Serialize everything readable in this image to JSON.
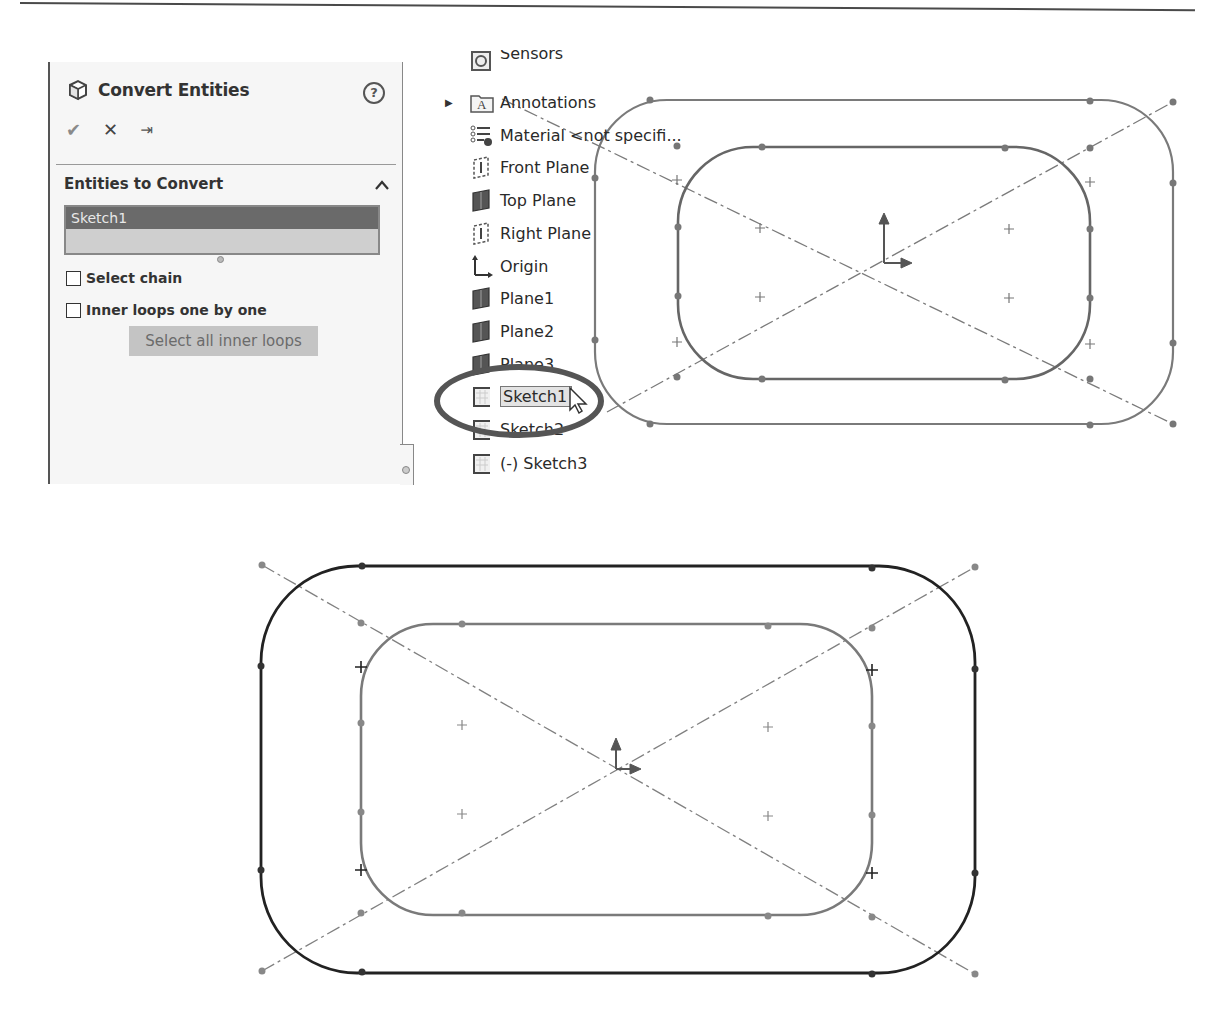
{
  "property_manager": {
    "title": "Convert Entities",
    "icons": {
      "title": "cube-icon",
      "help": "help-icon",
      "ok": "checkmark-icon",
      "cancel": "close-icon",
      "pin": "pushpin-icon"
    },
    "help_label": "?",
    "ok_label": "✔",
    "cancel_label": "✕",
    "pin_label": "⇥",
    "section": {
      "title": "Entities to Convert",
      "collapse_label": "^",
      "selection_list": [
        "Sketch1"
      ],
      "checkboxes": [
        {
          "label": "Select chain",
          "checked": false
        },
        {
          "label": "Inner loops one by one",
          "checked": false
        }
      ],
      "button_label": "Select all inner loops"
    }
  },
  "feature_tree": {
    "items": [
      {
        "label": "Sensors",
        "icon": "sensor-icon",
        "partially_visible": true
      },
      {
        "label": "Annotations",
        "icon": "annotations-folder-icon",
        "expandable": true
      },
      {
        "label": "Material <not specifi...",
        "icon": "material-icon"
      },
      {
        "label": "Front Plane",
        "icon": "plane-outline-icon"
      },
      {
        "label": "Top Plane",
        "icon": "plane-solid-icon"
      },
      {
        "label": "Right Plane",
        "icon": "plane-outline-icon"
      },
      {
        "label": "Origin",
        "icon": "origin-icon"
      },
      {
        "label": "Plane1",
        "icon": "plane-solid-icon"
      },
      {
        "label": "Plane2",
        "icon": "plane-solid-icon"
      },
      {
        "label": "Plane3",
        "icon": "plane-solid-icon",
        "partially_obscured": true
      },
      {
        "label": "Sketch1",
        "icon": "sketch-icon",
        "selected": true,
        "highlighted": true
      },
      {
        "label": "Sketch2",
        "icon": "sketch-icon",
        "partially_obscured": true
      },
      {
        "label": "(-) Sketch3",
        "icon": "sketch-icon"
      }
    ]
  },
  "colors": {
    "sketch_gray": "#777777",
    "converted_black": "#222222",
    "selection_bg": "#6a6a6a",
    "panel_bg": "#f6f6f6",
    "highlight_ring": "#555555"
  }
}
